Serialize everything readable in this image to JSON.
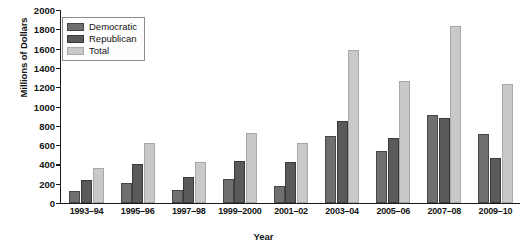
{
  "chart_data": {
    "type": "bar",
    "title": "",
    "xlabel": "Year",
    "ylabel": "Millions of Dollars",
    "ylim": [
      0,
      2000
    ],
    "ytick_step": 200,
    "yticks": [
      2000,
      1800,
      1600,
      1400,
      1200,
      1000,
      800,
      600,
      400,
      200,
      0
    ],
    "grid": false,
    "legend_position": "top-left",
    "categories": [
      "1993–94",
      "1995–96",
      "1997–98",
      "1999–2000",
      "2001–02",
      "2003–04",
      "2005–06",
      "2007–08",
      "2009–10"
    ],
    "series": [
      {
        "name": "Democratic",
        "color": "#6f6f6f",
        "values": [
          120,
          210,
          140,
          250,
          180,
          690,
          540,
          910,
          720
        ]
      },
      {
        "name": "Republican",
        "color": "#5a5a5a",
        "values": [
          235,
          400,
          265,
          435,
          420,
          855,
          670,
          880,
          470
        ]
      },
      {
        "name": "Total",
        "color": "#c9c9c9",
        "values": [
          360,
          620,
          420,
          730,
          620,
          1590,
          1260,
          1830,
          1235
        ]
      }
    ]
  }
}
